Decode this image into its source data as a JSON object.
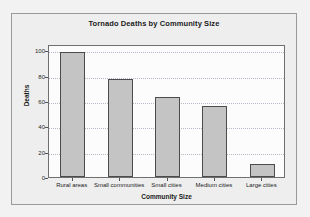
{
  "chart_data": {
    "type": "bar",
    "title": "Tornado Deaths by Community Size",
    "xlabel": "Community Size",
    "ylabel": "Deaths",
    "categories": [
      "Rural areas",
      "Small communities",
      "Small cities",
      "Medium cities",
      "Large cities"
    ],
    "values": [
      99,
      77,
      63,
      56,
      10
    ],
    "ylim": [
      0,
      105
    ],
    "yticks": [
      0,
      20,
      40,
      60,
      80,
      100
    ],
    "ytick_labels": [
      "0",
      "20",
      "40",
      "60",
      "80",
      "100"
    ],
    "grid": true,
    "legend": "none",
    "bar_fill_color": "#c4c4c4",
    "bar_edge_color": "#4c4c4c",
    "plot_background": "#fcfcfc",
    "panel_background": "#eeeeee",
    "figure_background": "#f2f2f2"
  }
}
